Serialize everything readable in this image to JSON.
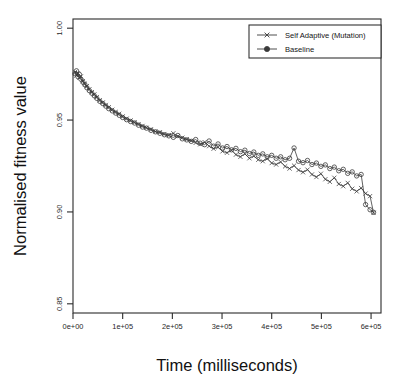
{
  "chart_data": {
    "type": "line",
    "title": "",
    "xlabel": "Time (milliseconds)",
    "ylabel": "Normalised fitness value",
    "xlim": [
      0,
      620000
    ],
    "ylim": [
      0.845,
      1.005
    ],
    "xticks": [
      0,
      100000,
      200000,
      300000,
      400000,
      500000,
      600000
    ],
    "xticklabels": [
      "0e+00",
      "1e+05",
      "2e+05",
      "3e+05",
      "4e+05",
      "5e+05",
      "6e+05"
    ],
    "yticks": [
      0.85,
      0.9,
      0.95,
      1.0
    ],
    "yticklabels": [
      "0.85",
      "0.90",
      "0.95",
      "1.00"
    ],
    "grid": false,
    "legend_position": "top-right",
    "line_color": "#3a3a3a",
    "axis_color": "#2b2b2b",
    "series": [
      {
        "name": "Self Adaptive (Mutation)",
        "marker": "x",
        "x": [
          4000,
          7000,
          10000,
          13000,
          16000,
          20000,
          24000,
          28000,
          33000,
          38000,
          43000,
          48000,
          54000,
          60000,
          66000,
          72000,
          79000,
          86000,
          93000,
          100000,
          108000,
          116000,
          124000,
          132000,
          140000,
          148000,
          157000,
          166000,
          175000,
          184000,
          193000,
          202000,
          211000,
          220000,
          229000,
          238000,
          247000,
          256000,
          265000,
          274000,
          283000,
          292000,
          301000,
          310000,
          319000,
          328000,
          337000,
          346000,
          355000,
          364000,
          373000,
          382000,
          391000,
          400000,
          409000,
          418000,
          427000,
          436000,
          445000,
          454000,
          463000,
          472000,
          481000,
          490000,
          499000,
          508000,
          517000,
          526000,
          535000,
          544000,
          553000,
          562000,
          571000,
          580000,
          589000,
          598000,
          605000
        ],
        "y": [
          0.976,
          0.9742,
          0.9755,
          0.973,
          0.9738,
          0.9712,
          0.9698,
          0.9685,
          0.9668,
          0.9652,
          0.964,
          0.9625,
          0.9608,
          0.9596,
          0.9582,
          0.957,
          0.9556,
          0.9544,
          0.9534,
          0.952,
          0.9508,
          0.9498,
          0.9488,
          0.9478,
          0.9468,
          0.9458,
          0.945,
          0.9438,
          0.9434,
          0.9424,
          0.9418,
          0.9428,
          0.9412,
          0.9404,
          0.9396,
          0.9388,
          0.9376,
          0.9368,
          0.938,
          0.9358,
          0.9344,
          0.9352,
          0.933,
          0.9322,
          0.9336,
          0.9312,
          0.93,
          0.9316,
          0.9292,
          0.9304,
          0.9284,
          0.9276,
          0.929,
          0.9266,
          0.9258,
          0.9272,
          0.9248,
          0.9236,
          0.9252,
          0.9228,
          0.9216,
          0.923,
          0.9204,
          0.919,
          0.9208,
          0.9178,
          0.9164,
          0.9186,
          0.9152,
          0.914,
          0.9158,
          0.9126,
          0.9112,
          0.913,
          0.91,
          0.9086,
          0.8995
        ]
      },
      {
        "name": "Baseline",
        "marker": "o",
        "x": [
          4000,
          7000,
          10000,
          13000,
          16000,
          20000,
          24000,
          28000,
          33000,
          38000,
          43000,
          48000,
          54000,
          60000,
          66000,
          72000,
          79000,
          86000,
          93000,
          100000,
          108000,
          116000,
          124000,
          132000,
          140000,
          148000,
          157000,
          166000,
          175000,
          184000,
          193000,
          202000,
          211000,
          220000,
          229000,
          238000,
          247000,
          256000,
          265000,
          274000,
          283000,
          292000,
          301000,
          310000,
          319000,
          328000,
          337000,
          346000,
          355000,
          364000,
          373000,
          382000,
          391000,
          400000,
          409000,
          418000,
          427000,
          436000,
          445000,
          454000,
          463000,
          472000,
          481000,
          490000,
          499000,
          508000,
          517000,
          526000,
          535000,
          544000,
          553000,
          562000,
          571000,
          580000,
          589000,
          598000,
          605000
        ],
        "y": [
          0.9752,
          0.9768,
          0.9736,
          0.9748,
          0.9722,
          0.9706,
          0.9692,
          0.9676,
          0.966,
          0.9646,
          0.9632,
          0.9618,
          0.9602,
          0.959,
          0.9576,
          0.9562,
          0.955,
          0.9538,
          0.9526,
          0.9514,
          0.9502,
          0.9492,
          0.9484,
          0.9472,
          0.9462,
          0.9456,
          0.9444,
          0.9436,
          0.9428,
          0.942,
          0.9414,
          0.9406,
          0.9416,
          0.9398,
          0.9392,
          0.9384,
          0.9394,
          0.9374,
          0.9366,
          0.9386,
          0.9358,
          0.937,
          0.9348,
          0.9356,
          0.9338,
          0.9346,
          0.9328,
          0.9336,
          0.9318,
          0.9326,
          0.9308,
          0.9316,
          0.93,
          0.9308,
          0.9292,
          0.93,
          0.9284,
          0.9292,
          0.9348,
          0.9276,
          0.9268,
          0.928,
          0.9258,
          0.9266,
          0.9248,
          0.9256,
          0.9236,
          0.9244,
          0.9224,
          0.9232,
          0.921,
          0.9218,
          0.9196,
          0.9204,
          0.904,
          0.9012,
          0.8998
        ]
      }
    ]
  },
  "legend": {
    "items": [
      {
        "label": "Self Adaptive (Mutation)",
        "marker": "x"
      },
      {
        "label": "Baseline",
        "marker": "o"
      }
    ]
  }
}
